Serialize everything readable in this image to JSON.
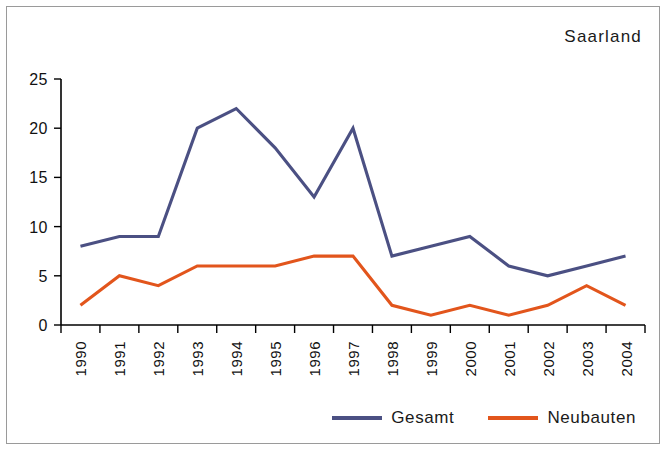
{
  "chart_data": {
    "type": "line",
    "title": "Saarland",
    "xlabel": "",
    "ylabel": "",
    "x": [
      "1990",
      "1991",
      "1992",
      "1993",
      "1994",
      "1995",
      "1996",
      "1997",
      "1998",
      "1999",
      "2000",
      "2001",
      "2002",
      "2003",
      "2004"
    ],
    "categories": [
      "1990",
      "1991",
      "1992",
      "1993",
      "1994",
      "1995",
      "1996",
      "1997",
      "1998",
      "1999",
      "2000",
      "2001",
      "2002",
      "2003",
      "2004"
    ],
    "yticks": [
      0,
      5,
      10,
      15,
      20,
      25
    ],
    "ylim": [
      0,
      25
    ],
    "grid": false,
    "legend_position": "bottom-right",
    "series": [
      {
        "name": "Gesamt",
        "color": "#4b5083",
        "values": [
          8,
          9,
          9,
          20,
          22,
          18,
          13,
          20,
          7,
          8,
          9,
          6,
          5,
          6,
          7
        ]
      },
      {
        "name": "Neubauten",
        "color": "#e2551c",
        "values": [
          2,
          5,
          4,
          6,
          6,
          6,
          7,
          7,
          2,
          1,
          2,
          1,
          2,
          4,
          2
        ]
      }
    ]
  },
  "legend": {
    "items": [
      {
        "label": "Gesamt",
        "color": "#4b5083"
      },
      {
        "label": "Neubauten",
        "color": "#e2551c"
      }
    ]
  },
  "colors": {
    "gesamt": "#4b5083",
    "neubauten": "#e2551c",
    "axis": "#000000",
    "frame": "#9a9a9a",
    "background": "#ffffff"
  }
}
